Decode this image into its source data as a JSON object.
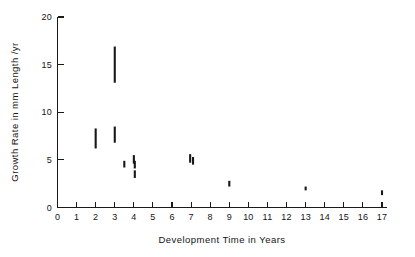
{
  "chart_data": {
    "type": "scatter",
    "title": "",
    "xlabel": "Development Time in Years",
    "ylabel": "Growth Rate in mm Length /yr",
    "xlim": [
      0,
      17.6
    ],
    "ylim": [
      0,
      20
    ],
    "grid": false,
    "legend": null,
    "xticks": [
      0,
      1,
      2,
      3,
      4,
      5,
      6,
      7,
      8,
      9,
      10,
      11,
      12,
      13,
      14,
      15,
      16,
      17
    ],
    "xtick_labels": [
      "0",
      "1",
      "2",
      "3",
      "4",
      "5",
      "6",
      "7",
      "8",
      "9",
      "10",
      "11",
      "12",
      "13",
      "14",
      "15",
      "16",
      "17"
    ],
    "yticks": [
      0,
      5,
      10,
      15,
      20
    ],
    "ytick_labels": [
      "0",
      "5",
      "10",
      "15",
      "20"
    ],
    "marker_style": "vertical-range-bar",
    "series": [
      {
        "name": "Growth rate range",
        "color": "#171717",
        "points": [
          {
            "x": 2.0,
            "y_low": 6.2,
            "y_high": 8.3
          },
          {
            "x": 3.0,
            "y_low": 13.1,
            "y_high": 16.9
          },
          {
            "x": 3.0,
            "y_low": 6.8,
            "y_high": 8.5
          },
          {
            "x": 3.5,
            "y_low": 4.2,
            "y_high": 4.9
          },
          {
            "x": 4.0,
            "y_low": 4.6,
            "y_high": 5.5
          },
          {
            "x": 4.05,
            "y_low": 4.1,
            "y_high": 4.9
          },
          {
            "x": 4.05,
            "y_low": 3.1,
            "y_high": 3.9
          },
          {
            "x": 6.95,
            "y_low": 4.7,
            "y_high": 5.6
          },
          {
            "x": 7.1,
            "y_low": 4.5,
            "y_high": 5.3
          },
          {
            "x": 9.0,
            "y_low": 2.2,
            "y_high": 2.8
          },
          {
            "x": 13.0,
            "y_low": 1.8,
            "y_high": 2.2
          },
          {
            "x": 17.0,
            "y_low": 1.3,
            "y_high": 1.8
          }
        ]
      }
    ]
  },
  "axes": {
    "x_title": "Development Time in Years",
    "y_title": "Growth Rate in mm Length /yr"
  }
}
